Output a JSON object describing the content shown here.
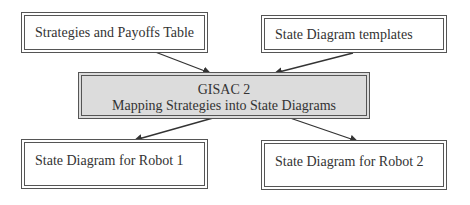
{
  "diagram": {
    "nodes": {
      "strategies_table": {
        "label": "Strategies and Payoffs Table"
      },
      "templates": {
        "label": "State Diagram templates"
      },
      "gisac": {
        "title": "GISAC 2",
        "subtitle": "Mapping Strategies into State Diagrams",
        "fill": "#dcdcdc"
      },
      "robot1": {
        "label": "State Diagram for Robot 1"
      },
      "robot2": {
        "label": "State Diagram for Robot 2"
      }
    },
    "edges": [
      {
        "from": "strategies_table",
        "to": "gisac"
      },
      {
        "from": "templates",
        "to": "gisac"
      },
      {
        "from": "gisac",
        "to": "robot1"
      },
      {
        "from": "gisac",
        "to": "robot2"
      }
    ]
  }
}
